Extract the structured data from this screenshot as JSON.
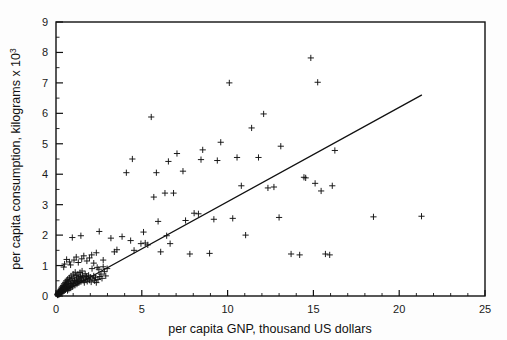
{
  "chart_data": {
    "type": "scatter",
    "title": "",
    "xlabel": "per capita GNP, thousand US dollars",
    "ylabel_main": "per capita consumption, kilograms x 10",
    "ylabel_exponent": "3",
    "ylabel_full": "per capita consumption, kilograms x 10^3",
    "xlim": [
      0,
      25
    ],
    "ylim": [
      0,
      9
    ],
    "xticks": [
      0,
      5,
      10,
      15,
      20,
      25
    ],
    "yticks": [
      0,
      1,
      2,
      3,
      4,
      5,
      6,
      7,
      8,
      9
    ],
    "xticklabels": [
      "0",
      "5",
      "10",
      "15",
      "20",
      "25"
    ],
    "yticklabels": [
      "0",
      "1",
      "2",
      "3",
      "4",
      "5",
      "6",
      "7",
      "8",
      "9"
    ],
    "x_minor_tick_step": 1,
    "y_minor_tick_step": 0.5,
    "grid": false,
    "legend": null,
    "marker": "plus",
    "marker_color": "#111111",
    "frame_color": "#111111",
    "background_color": "#ffffff",
    "series": [
      {
        "name": "countries",
        "marker": "plus",
        "points": [
          [
            0.08,
            0.04
          ],
          [
            0.09,
            0.06
          ],
          [
            0.1,
            0.03
          ],
          [
            0.11,
            0.08
          ],
          [
            0.12,
            0.05
          ],
          [
            0.13,
            0.1
          ],
          [
            0.14,
            0.07
          ],
          [
            0.15,
            0.12
          ],
          [
            0.16,
            0.05
          ],
          [
            0.17,
            0.09
          ],
          [
            0.18,
            0.14
          ],
          [
            0.19,
            0.06
          ],
          [
            0.2,
            0.11
          ],
          [
            0.21,
            0.16
          ],
          [
            0.22,
            0.08
          ],
          [
            0.23,
            0.13
          ],
          [
            0.24,
            0.19
          ],
          [
            0.25,
            0.09
          ],
          [
            0.26,
            0.15
          ],
          [
            0.27,
            0.22
          ],
          [
            0.28,
            0.12
          ],
          [
            0.29,
            0.18
          ],
          [
            0.3,
            0.26
          ],
          [
            0.31,
            0.1
          ],
          [
            0.32,
            0.21
          ],
          [
            0.34,
            0.16
          ],
          [
            0.35,
            0.3
          ],
          [
            0.36,
            0.13
          ],
          [
            0.38,
            0.24
          ],
          [
            0.4,
            0.19
          ],
          [
            0.41,
            0.35
          ],
          [
            0.42,
            0.15
          ],
          [
            0.44,
            0.28
          ],
          [
            0.45,
            0.22
          ],
          [
            0.47,
            0.4
          ],
          [
            0.48,
            0.17
          ],
          [
            0.5,
            0.33
          ],
          [
            0.52,
            0.25
          ],
          [
            0.54,
            0.45
          ],
          [
            0.55,
            0.2
          ],
          [
            0.57,
            0.38
          ],
          [
            0.58,
            0.29
          ],
          [
            0.6,
            0.5
          ],
          [
            0.62,
            0.24
          ],
          [
            0.64,
            0.42
          ],
          [
            0.65,
            0.33
          ],
          [
            0.67,
            0.18
          ],
          [
            0.68,
            0.55
          ],
          [
            0.7,
            0.28
          ],
          [
            0.72,
            0.47
          ],
          [
            0.74,
            0.36
          ],
          [
            0.75,
            0.22
          ],
          [
            0.78,
            0.6
          ],
          [
            0.8,
            0.31
          ],
          [
            0.82,
            0.52
          ],
          [
            0.84,
            0.41
          ],
          [
            0.86,
            0.26
          ],
          [
            0.88,
            0.66
          ],
          [
            0.9,
            0.36
          ],
          [
            0.92,
            0.57
          ],
          [
            0.95,
            0.46
          ],
          [
            0.97,
            0.3
          ],
          [
            1.0,
            0.72
          ],
          [
            1.02,
            0.41
          ],
          [
            1.05,
            0.62
          ],
          [
            1.08,
            0.51
          ],
          [
            1.1,
            0.35
          ],
          [
            1.12,
            0.78
          ],
          [
            1.15,
            0.45
          ],
          [
            1.18,
            0.67
          ],
          [
            1.2,
            0.56
          ],
          [
            1.22,
            0.39
          ],
          [
            1.25,
            0.48
          ],
          [
            1.28,
            0.72
          ],
          [
            1.3,
            0.6
          ],
          [
            1.33,
            0.43
          ],
          [
            1.36,
            0.52
          ],
          [
            1.4,
            0.77
          ],
          [
            1.42,
            0.64
          ],
          [
            1.45,
            0.47
          ],
          [
            1.48,
            0.56
          ],
          [
            1.52,
            0.82
          ],
          [
            1.55,
            0.68
          ],
          [
            1.58,
            0.51
          ],
          [
            1.62,
            0.6
          ],
          [
            1.65,
            0.44
          ],
          [
            1.7,
            0.73
          ],
          [
            1.74,
            0.55
          ],
          [
            1.78,
            0.64
          ],
          [
            1.82,
            0.48
          ],
          [
            1.86,
            0.58
          ],
          [
            1.9,
            0.68
          ],
          [
            1.95,
            0.52
          ],
          [
            2.0,
            0.62
          ],
          [
            2.05,
            0.46
          ],
          [
            2.1,
            0.9
          ],
          [
            2.15,
            0.56
          ],
          [
            2.2,
            0.66
          ],
          [
            2.25,
            0.5
          ],
          [
            2.3,
            0.6
          ],
          [
            2.35,
            0.44
          ],
          [
            2.4,
            0.94
          ],
          [
            2.45,
            0.54
          ],
          [
            2.5,
            0.88
          ],
          [
            2.55,
            0.64
          ],
          [
            2.62,
            0.72
          ],
          [
            2.68,
            0.58
          ],
          [
            2.75,
            0.96
          ],
          [
            2.82,
            0.8
          ],
          [
            2.9,
            0.66
          ],
          [
            2.98,
            0.9
          ],
          [
            0.45,
            0.95
          ],
          [
            0.5,
            1.05
          ],
          [
            0.62,
            1.2
          ],
          [
            0.78,
            1.12
          ],
          [
            0.85,
            1.02
          ],
          [
            0.95,
            1.92
          ],
          [
            1.05,
            1.18
          ],
          [
            1.18,
            1.28
          ],
          [
            1.3,
            1.1
          ],
          [
            1.45,
            1.98
          ],
          [
            1.5,
            1.22
          ],
          [
            1.62,
            1.32
          ],
          [
            1.8,
            1.15
          ],
          [
            1.95,
            1.25
          ],
          [
            2.08,
            1.35
          ],
          [
            2.2,
            1.08
          ],
          [
            2.35,
            1.42
          ],
          [
            2.52,
            2.12
          ],
          [
            2.75,
            1.18
          ],
          [
            3.2,
            1.9
          ],
          [
            3.4,
            1.45
          ],
          [
            3.55,
            1.52
          ],
          [
            3.85,
            1.95
          ],
          [
            4.1,
            4.05
          ],
          [
            4.35,
            1.82
          ],
          [
            4.45,
            4.5
          ],
          [
            4.55,
            1.5
          ],
          [
            4.95,
            1.72
          ],
          [
            5.1,
            2.1
          ],
          [
            5.2,
            1.74
          ],
          [
            5.35,
            1.68
          ],
          [
            5.55,
            5.88
          ],
          [
            5.7,
            3.25
          ],
          [
            5.85,
            4.05
          ],
          [
            5.95,
            2.45
          ],
          [
            6.1,
            1.45
          ],
          [
            6.35,
            3.38
          ],
          [
            6.45,
            1.98
          ],
          [
            6.55,
            4.42
          ],
          [
            6.65,
            1.72
          ],
          [
            6.85,
            3.38
          ],
          [
            7.05,
            4.68
          ],
          [
            7.4,
            4.1
          ],
          [
            7.55,
            2.48
          ],
          [
            7.8,
            1.38
          ],
          [
            8.05,
            2.72
          ],
          [
            8.3,
            2.7
          ],
          [
            8.45,
            4.48
          ],
          [
            8.55,
            4.8
          ],
          [
            8.95,
            1.4
          ],
          [
            9.2,
            2.52
          ],
          [
            9.4,
            4.45
          ],
          [
            9.6,
            5.05
          ],
          [
            10.1,
            7.0
          ],
          [
            10.3,
            2.55
          ],
          [
            10.55,
            4.55
          ],
          [
            10.8,
            3.62
          ],
          [
            11.05,
            2.0
          ],
          [
            11.4,
            5.52
          ],
          [
            11.8,
            4.55
          ],
          [
            12.1,
            5.98
          ],
          [
            12.35,
            3.55
          ],
          [
            12.7,
            3.58
          ],
          [
            13.0,
            2.58
          ],
          [
            13.1,
            4.92
          ],
          [
            13.7,
            1.38
          ],
          [
            14.2,
            1.35
          ],
          [
            14.45,
            3.9
          ],
          [
            14.55,
            3.88
          ],
          [
            14.85,
            7.82
          ],
          [
            15.1,
            3.7
          ],
          [
            15.25,
            7.02
          ],
          [
            15.45,
            3.45
          ],
          [
            15.7,
            1.38
          ],
          [
            15.95,
            1.35
          ],
          [
            16.1,
            3.62
          ],
          [
            16.25,
            4.78
          ],
          [
            18.5,
            2.6
          ],
          [
            21.3,
            2.62
          ]
        ]
      }
    ],
    "regression_line": {
      "name": "fitted-line",
      "x_start": 0.0,
      "y_start": 0.0,
      "x_end": 21.3,
      "y_end": 6.6,
      "color": "#111111"
    }
  }
}
